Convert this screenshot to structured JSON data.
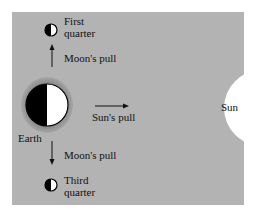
{
  "diagram": {
    "background_color": "#b3b3b3",
    "labels": {
      "first_quarter_line1": "First",
      "first_quarter_line2": "quarter",
      "moon_pull_top": "Moon's pull",
      "suns_pull": "Sun's pull",
      "earth": "Earth",
      "moon_pull_bottom": "Moon's pull",
      "third_quarter_line1": "Third",
      "third_quarter_line2": "quarter",
      "sun": "Sun"
    },
    "bodies": [
      {
        "name": "Earth",
        "phase": "left half dark, right half lit"
      },
      {
        "name": "Moon (first quarter)",
        "phase": "left half dark, right half lit"
      },
      {
        "name": "Moon (third quarter)",
        "phase": "left half dark, right half lit"
      },
      {
        "name": "Sun",
        "shown": "partial disc at right edge"
      }
    ],
    "arrows": [
      {
        "label": "Moon's pull",
        "direction": "up"
      },
      {
        "label": "Sun's pull",
        "direction": "right"
      },
      {
        "label": "Moon's pull",
        "direction": "down"
      }
    ]
  }
}
